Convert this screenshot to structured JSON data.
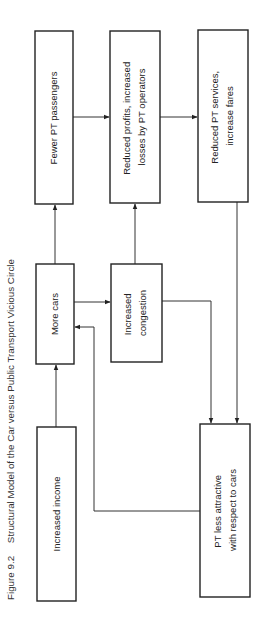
{
  "figure": {
    "number": "Figure 9.2",
    "title": "Structural Model of the Car versus Public Transport Vicious Circle"
  },
  "nodes": {
    "increased_income": {
      "lines": [
        "Increased income"
      ]
    },
    "more_cars": {
      "lines": [
        "More cars"
      ]
    },
    "fewer_pt_passengers": {
      "lines": [
        "Fewer PT passengers"
      ]
    },
    "increased_congestion": {
      "lines": [
        "Increased",
        "congestion"
      ]
    },
    "reduced_profits": {
      "lines": [
        "Reduced profits, increased",
        "losses by PT operators"
      ]
    },
    "reduced_pt_services": {
      "lines": [
        "Reduced PT services,",
        "increase fares"
      ]
    },
    "pt_less_attractive": {
      "lines": [
        "PT less attractive",
        "with respect to cars"
      ]
    }
  },
  "edges": [
    {
      "from": "Increased income",
      "to": "More cars"
    },
    {
      "from": "More cars",
      "to": "Fewer PT passengers"
    },
    {
      "from": "More cars",
      "to": "Increased congestion"
    },
    {
      "from": "Fewer PT passengers",
      "to": "Reduced profits, increased losses by PT operators"
    },
    {
      "from": "Increased congestion",
      "to": "Reduced profits, increased losses by PT operators"
    },
    {
      "from": "Reduced profits, increased losses by PT operators",
      "to": "Reduced PT services, increase fares"
    },
    {
      "from": "Increased congestion",
      "to": "PT less attractive with respect to cars"
    },
    {
      "from": "Reduced PT services, increase fares",
      "to": "PT less attractive with respect to cars"
    },
    {
      "from": "PT less attractive with respect to cars",
      "to": "More cars"
    }
  ]
}
